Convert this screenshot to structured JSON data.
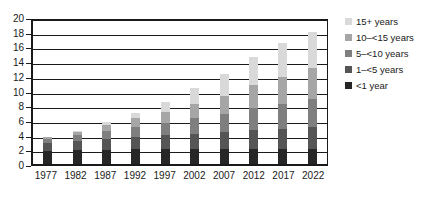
{
  "chart_data": {
    "type": "bar",
    "stacked": true,
    "title": "",
    "subtitle": "",
    "xlabel": "",
    "ylabel": "",
    "ylim": [
      0,
      20
    ],
    "ytick_step": 2,
    "yticks": [
      0,
      2,
      4,
      6,
      8,
      10,
      12,
      14,
      16,
      18,
      20
    ],
    "grid": true,
    "grid_axis": "y",
    "legend_position": "right",
    "categories": [
      "1977",
      "1982",
      "1987",
      "1992",
      "1997",
      "2002",
      "2007",
      "2012",
      "2017",
      "2022"
    ],
    "series": [
      {
        "name": "<1 year",
        "color": "#262626",
        "values": [
          1.8,
          1.9,
          1.9,
          2.0,
          2.0,
          2.0,
          2.0,
          2.0,
          2.0,
          2.0
        ]
      },
      {
        "name": "1–<5 years",
        "color": "#555555",
        "values": [
          1.0,
          1.2,
          1.5,
          1.7,
          1.9,
          2.1,
          2.3,
          2.6,
          2.8,
          3.0
        ]
      },
      {
        "name": "5–<10 years",
        "color": "#7f7f7f",
        "values": [
          0.6,
          0.8,
          1.1,
          1.4,
          1.7,
          2.1,
          2.5,
          3.0,
          3.4,
          3.8
        ]
      },
      {
        "name": "10–<15 years",
        "color": "#a6a6a6",
        "values": [
          0.3,
          0.5,
          0.8,
          1.1,
          1.5,
          2.0,
          2.5,
          3.1,
          3.7,
          4.2
        ]
      },
      {
        "name": "15+ years",
        "color": "#d9d9d9",
        "values": [
          0.0,
          0.1,
          0.4,
          0.8,
          1.4,
          2.1,
          2.9,
          3.8,
          4.6,
          5.0
        ]
      }
    ],
    "totals": [
      3.7,
      4.5,
      5.7,
      7.0,
      8.5,
      10.3,
      12.2,
      14.5,
      16.5,
      18.0
    ]
  },
  "legend": {
    "items": [
      {
        "label": "15+ years",
        "color": "#d9d9d9"
      },
      {
        "label": "10–<15 years",
        "color": "#a6a6a6"
      },
      {
        "label": "5–<10 years",
        "color": "#7f7f7f"
      },
      {
        "label": "1–<5 years",
        "color": "#555555"
      },
      {
        "label": "<1 year",
        "color": "#262626"
      }
    ]
  },
  "style": {
    "axis_color": "#1a1a1a",
    "grid_color": "#1a1a1a",
    "background": "#ffffff"
  }
}
